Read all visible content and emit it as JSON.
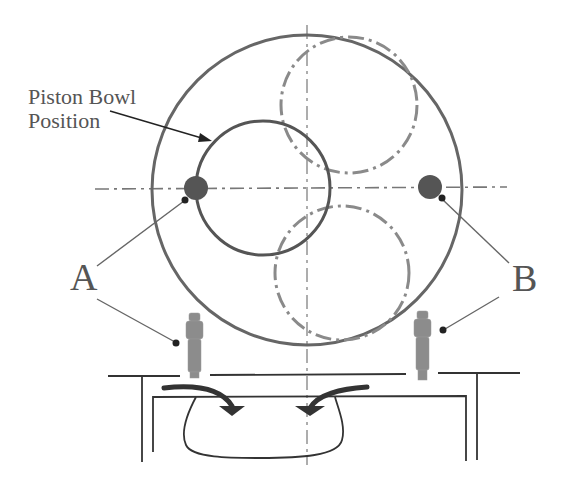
{
  "diagram": {
    "type": "engine-cylinder-top-and-section-view",
    "labels": {
      "bowl_label_line1": "Piston Bowl",
      "bowl_label_line2": "Position",
      "label_a": "A",
      "label_b": "B"
    },
    "colors": {
      "outline": "#666666",
      "dark": "#333333",
      "dashed": "#8a8a8a",
      "injector": "#8c8c8c",
      "background": "#ffffff"
    },
    "elements": {
      "cylinder_bore": {
        "cx": 307,
        "cy": 190,
        "r": 155
      },
      "piston_bowl": {
        "cx": 263,
        "cy": 188,
        "r": 67
      },
      "valve_upper": {
        "cx": 349,
        "cy": 105,
        "r": 68
      },
      "valve_lower": {
        "cx": 342,
        "cy": 273,
        "r": 67
      },
      "injector_a_point": {
        "cx": 196,
        "cy": 188,
        "r": 12
      },
      "injector_b_point": {
        "cx": 430,
        "cy": 187,
        "r": 12
      }
    }
  }
}
